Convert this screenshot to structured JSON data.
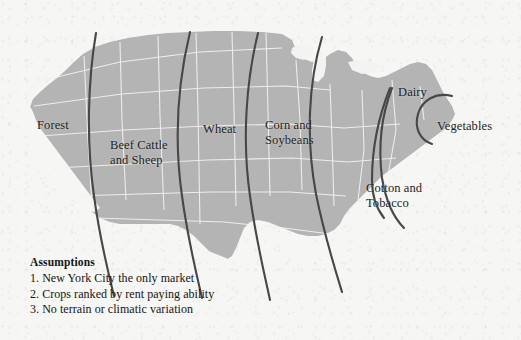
{
  "figure": {
    "background_color": "#f6f6f4",
    "land_color": "#b4b4b4",
    "state_border_color": "#f2f2f0",
    "water_color": "#f3f3f1",
    "arc_color": "#474747",
    "text_color": "#1c1c1c"
  },
  "map": {
    "region_labels": [
      {
        "id": "forest",
        "text": "Forest",
        "x": 37,
        "y": 118
      },
      {
        "id": "beef-cattle-and-sheep",
        "text": "Beef Cattle\nand Sheep",
        "x": 110,
        "y": 138
      },
      {
        "id": "wheat",
        "text": "Wheat",
        "x": 203,
        "y": 122
      },
      {
        "id": "corn-and-soybeans",
        "text": "Corn and\nSoybeans",
        "x": 265,
        "y": 118
      },
      {
        "id": "dairy",
        "text": "Dairy",
        "x": 398,
        "y": 85
      },
      {
        "id": "vegetables",
        "text": "Vegetables",
        "x": 437,
        "y": 119
      },
      {
        "id": "cotton-and-tobacco",
        "text": "Cotton and\nTobacco",
        "x": 366,
        "y": 181
      }
    ],
    "zone_boundaries": [
      {
        "id": "forest-beef-boundary",
        "label": "boundary between Forest and Beef Cattle"
      },
      {
        "id": "beef-wheat-boundary",
        "label": "boundary between Beef Cattle and Wheat"
      },
      {
        "id": "wheat-corn-boundary",
        "label": "boundary between Wheat and Corn"
      },
      {
        "id": "corn-cotton-boundary",
        "label": "boundary between Corn and Cotton"
      },
      {
        "id": "cotton-dairy-boundary",
        "label": "boundary between Cotton and Dairy"
      },
      {
        "id": "dairy-boundary",
        "label": "inner Dairy boundary"
      },
      {
        "id": "vegetables-boundary",
        "label": "Vegetables boundary around New York City"
      }
    ]
  },
  "legend": {
    "title": "Assumptions",
    "items": [
      "1. New York City the only market",
      "2. Crops ranked by rent paying ability",
      "3. No terrain or climatic variation"
    ]
  }
}
